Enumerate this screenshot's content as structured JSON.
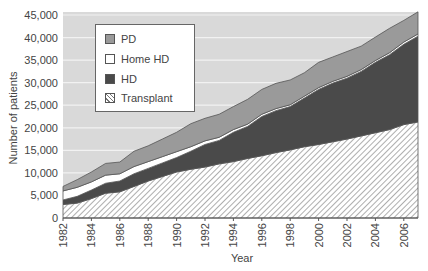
{
  "chart_data": {
    "type": "area",
    "stacked": true,
    "title": "",
    "xlabel": "Year",
    "ylabel": "Number of patients",
    "ylim": [
      0,
      45000
    ],
    "xlim": [
      1982,
      2007
    ],
    "grid": {
      "y": true,
      "x": false
    },
    "yticks": [
      0,
      5000,
      10000,
      15000,
      20000,
      25000,
      30000,
      35000,
      40000,
      45000
    ],
    "ytick_labels": [
      "0",
      "5,000",
      "10,000",
      "15,000",
      "20,000",
      "25,000",
      "30,000",
      "35,000",
      "40,000",
      "45,000"
    ],
    "xtick_labels": [
      "1982",
      "1984",
      "1986",
      "1988",
      "1990",
      "1992",
      "1994",
      "1996",
      "1998",
      "2000",
      "2002",
      "2004",
      "2006"
    ],
    "legend_position": "upper-left",
    "x": [
      1982,
      1983,
      1984,
      1985,
      1986,
      1987,
      1988,
      1989,
      1990,
      1991,
      1992,
      1993,
      1994,
      1995,
      1996,
      1997,
      1998,
      1999,
      2000,
      2001,
      2002,
      2003,
      2004,
      2005,
      2006,
      2007
    ],
    "series": [
      {
        "name": "Transplant",
        "fill": "hatch",
        "values": [
          3000,
          3300,
          4300,
          5500,
          5800,
          7000,
          8200,
          9200,
          10200,
          10800,
          11300,
          12000,
          12500,
          13200,
          13800,
          14500,
          15100,
          15800,
          16300,
          16900,
          17500,
          18200,
          18900,
          19600,
          20700,
          21300
        ]
      },
      {
        "name": "HD",
        "fill": "#4a4a4a",
        "values": [
          1000,
          1500,
          1900,
          2200,
          2400,
          2800,
          2800,
          3000,
          3200,
          4000,
          5000,
          5200,
          6500,
          7100,
          8700,
          9300,
          9600,
          10800,
          12200,
          13000,
          13500,
          14300,
          15600,
          16600,
          17800,
          19000
        ]
      },
      {
        "name": "Home HD",
        "fill": "#ffffff",
        "values": [
          2000,
          2000,
          1800,
          1800,
          1600,
          1600,
          1500,
          1400,
          1300,
          1000,
          800,
          700,
          600,
          500,
          500,
          450,
          400,
          400,
          400,
          400,
          400,
          400,
          400,
          450,
          500,
          500
        ]
      },
      {
        "name": "PD",
        "fill": "#9a9a9a",
        "values": [
          1000,
          1700,
          2200,
          2600,
          2600,
          3400,
          3500,
          3900,
          4300,
          5100,
          5000,
          5100,
          5100,
          5500,
          5500,
          5600,
          5500,
          5200,
          5600,
          5400,
          5500,
          5200,
          5200,
          5400,
          4800,
          4900
        ]
      }
    ]
  },
  "legend": {
    "items": [
      {
        "label": "PD",
        "color": "#9a9a9a"
      },
      {
        "label": "Home HD",
        "color": "#ffffff"
      },
      {
        "label": "HD",
        "color": "#4a4a4a"
      },
      {
        "label": "Transplant",
        "color": "hatch"
      }
    ]
  },
  "colors": {
    "plot_bg": "#d9d9d9",
    "gridline": "#f2f2f2",
    "pd": "#9a9a9a",
    "home_hd": "#ffffff",
    "hd": "#4a4a4a",
    "transplant_bg": "#ffffff",
    "transplant_hatch": "#777777",
    "outline": "#555555"
  }
}
